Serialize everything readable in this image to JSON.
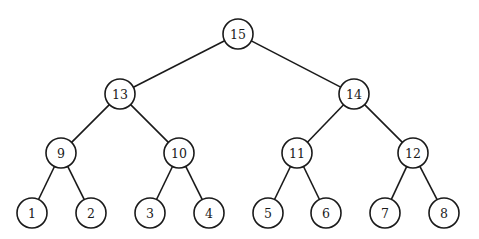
{
  "diagram": {
    "type": "binary-tree",
    "node_radius": 15,
    "colors": {
      "stroke": "#1a1a1a",
      "fill": "#ffffff",
      "background": "#ffffff"
    },
    "nodes": [
      {
        "id": "n15",
        "label": "15",
        "x": 238,
        "y": 34,
        "level": 0
      },
      {
        "id": "n13",
        "label": "13",
        "x": 120,
        "y": 94,
        "level": 1
      },
      {
        "id": "n14",
        "label": "14",
        "x": 354,
        "y": 94,
        "level": 1
      },
      {
        "id": "n9",
        "label": "9",
        "x": 61,
        "y": 153,
        "level": 2
      },
      {
        "id": "n10",
        "label": "10",
        "x": 179,
        "y": 153,
        "level": 2
      },
      {
        "id": "n11",
        "label": "11",
        "x": 297,
        "y": 153,
        "level": 2
      },
      {
        "id": "n12",
        "label": "12",
        "x": 413,
        "y": 153,
        "level": 2
      },
      {
        "id": "n1",
        "label": "1",
        "x": 32,
        "y": 213,
        "level": 3
      },
      {
        "id": "n2",
        "label": "2",
        "x": 91,
        "y": 213,
        "level": 3
      },
      {
        "id": "n3",
        "label": "3",
        "x": 150,
        "y": 213,
        "level": 3
      },
      {
        "id": "n4",
        "label": "4",
        "x": 209,
        "y": 213,
        "level": 3
      },
      {
        "id": "n5",
        "label": "5",
        "x": 268,
        "y": 213,
        "level": 3
      },
      {
        "id": "n6",
        "label": "6",
        "x": 326,
        "y": 213,
        "level": 3
      },
      {
        "id": "n7",
        "label": "7",
        "x": 385,
        "y": 213,
        "level": 3
      },
      {
        "id": "n8",
        "label": "8",
        "x": 444,
        "y": 213,
        "level": 3
      }
    ],
    "edges": [
      {
        "from": "n15",
        "to": "n13"
      },
      {
        "from": "n15",
        "to": "n14"
      },
      {
        "from": "n13",
        "to": "n9"
      },
      {
        "from": "n13",
        "to": "n10"
      },
      {
        "from": "n14",
        "to": "n11"
      },
      {
        "from": "n14",
        "to": "n12"
      },
      {
        "from": "n9",
        "to": "n1"
      },
      {
        "from": "n9",
        "to": "n2"
      },
      {
        "from": "n10",
        "to": "n3"
      },
      {
        "from": "n10",
        "to": "n4"
      },
      {
        "from": "n11",
        "to": "n5"
      },
      {
        "from": "n11",
        "to": "n6"
      },
      {
        "from": "n12",
        "to": "n7"
      },
      {
        "from": "n12",
        "to": "n8"
      }
    ]
  }
}
